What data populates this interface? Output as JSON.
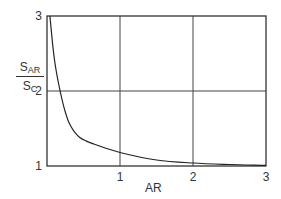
{
  "chart_data": {
    "type": "line",
    "title": "",
    "xlabel": "AR",
    "ylabel": "S_AR / S_C",
    "ylabel_parts": {
      "num_main": "S",
      "num_sub": "AR",
      "den_main": "S",
      "den_sub": "C"
    },
    "xlim": [
      0,
      3
    ],
    "ylim": [
      1,
      3
    ],
    "x_ticks": [
      "1",
      "2",
      "3"
    ],
    "y_ticks": [
      "1",
      "2",
      "3"
    ],
    "grid": true,
    "series": [
      {
        "name": "S_AR/S_C",
        "x": [
          0.04,
          0.08,
          0.12,
          0.18,
          0.25,
          0.32,
          0.45,
          0.65,
          1.0,
          1.5,
          2.0,
          2.5,
          3.0
        ],
        "y": [
          3.0,
          2.6,
          2.3,
          2.0,
          1.72,
          1.54,
          1.38,
          1.29,
          1.18,
          1.08,
          1.04,
          1.02,
          1.01
        ]
      }
    ]
  }
}
